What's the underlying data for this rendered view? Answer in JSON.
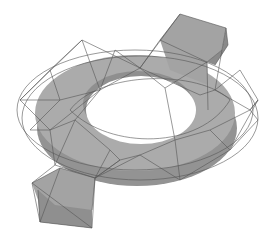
{
  "figure": {
    "colors": {
      "background": "#ffffff",
      "solid_fill": "#a8a8a8",
      "solid_dark": "#8e8e8e",
      "hole_fill": "#ffffff",
      "wire": "#555555"
    }
  }
}
